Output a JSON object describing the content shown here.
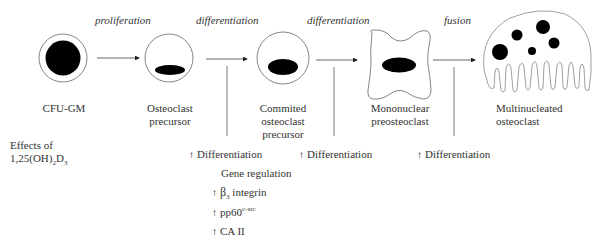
{
  "diagram": {
    "stages": [
      {
        "id": "cfu-gm",
        "label_lines": [
          "CFU-GM"
        ]
      },
      {
        "id": "osteoclast-precursor",
        "label_lines": [
          "Osteoclast",
          "precursor"
        ]
      },
      {
        "id": "committed-precursor",
        "label_lines": [
          "Commited",
          "osteoclast",
          "precursor"
        ]
      },
      {
        "id": "mononuclear-preosteoclast",
        "label_lines": [
          "Mononuclear",
          "preosteoclast"
        ]
      },
      {
        "id": "multinucleated-osteoclast",
        "label_lines": [
          "Multinucleated",
          "osteoclast"
        ]
      }
    ],
    "transitions": [
      {
        "label": "proliferation"
      },
      {
        "label": "differentiation"
      },
      {
        "label": "differentiation"
      },
      {
        "label": "fusion"
      }
    ],
    "effects_title": {
      "line1": "Effects of",
      "line2_prefix": "1,25(OH)",
      "line2_sub1": "2",
      "line2_mid": "D",
      "line2_sub2": "3"
    },
    "effects": [
      {
        "arrow": "↑",
        "text": "Differentiation"
      },
      {
        "arrow": "↑",
        "text": "Differentiation"
      },
      {
        "arrow": "↑",
        "text": "Differentiation"
      }
    ],
    "gene_regulation": {
      "title": "Gene regulation",
      "items": [
        {
          "arrow": "↑",
          "prefix": "β",
          "sub": "3",
          "text": " integrin"
        },
        {
          "arrow": "↑",
          "prefix": "pp60",
          "sup": "c-src",
          "text": ""
        },
        {
          "arrow": "↑",
          "prefix": "CA II",
          "text": ""
        }
      ]
    },
    "colors": {
      "line": "#555555",
      "nucleus": "#000000",
      "text": "#333333"
    }
  }
}
